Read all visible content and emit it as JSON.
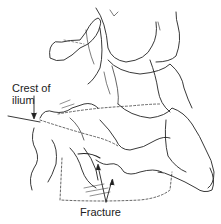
{
  "diagram": {
    "labels": {
      "crest_line1": "Crest of",
      "crest_line2": "ilium",
      "fracture": "Fracture"
    },
    "colors": {
      "line": "#222222",
      "background": "#ffffff"
    }
  }
}
